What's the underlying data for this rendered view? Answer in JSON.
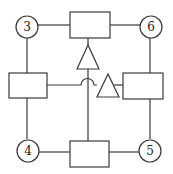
{
  "diagram": {
    "colors": {
      "stroke": "#3a3a3a",
      "background": "#ffffff",
      "text": "#222222"
    },
    "nodes": {
      "circle_3": {
        "label": "3",
        "cx": 27,
        "cy": 27,
        "r": 11
      },
      "circle_6": {
        "label": "6",
        "cx": 151,
        "cy": 27,
        "r": 11
      },
      "circle_4": {
        "label": "4",
        "cx": 28,
        "cy": 150,
        "r": 11
      },
      "circle_5": {
        "label": "5",
        "cx": 150,
        "cy": 150,
        "r": 11
      }
    },
    "boxes": {
      "top": {
        "x": 70,
        "y": 12,
        "w": 40,
        "h": 26
      },
      "left": {
        "x": 9,
        "y": 73,
        "w": 38,
        "h": 25
      },
      "right": {
        "x": 123,
        "y": 73,
        "w": 40,
        "h": 26
      },
      "bottom": {
        "x": 70,
        "y": 141,
        "w": 39,
        "h": 26
      }
    },
    "triangles": {
      "upper": {
        "orientation": "up",
        "points": "88,45 77,69 99,69"
      },
      "right": {
        "orientation": "up",
        "points": "108,74 97,97 119,97"
      }
    },
    "connections": [
      {
        "from": "circle_3",
        "to": "top-box"
      },
      {
        "from": "top-box",
        "to": "circle_6"
      },
      {
        "from": "circle_3",
        "to": "left-box"
      },
      {
        "from": "circle_6",
        "to": "right-box"
      },
      {
        "from": "left-box",
        "to": "circle_4"
      },
      {
        "from": "right-box",
        "to": "circle_5"
      },
      {
        "from": "circle_4",
        "to": "bottom-box"
      },
      {
        "from": "bottom-box",
        "to": "circle_5"
      },
      {
        "from": "bottom-box",
        "to": "upper-triangle",
        "via": "vertical-line"
      },
      {
        "from": "left-box",
        "to": "right-triangle",
        "via": "line-hop-crossing"
      },
      {
        "from": "right-triangle",
        "to": "right-box"
      }
    ]
  }
}
